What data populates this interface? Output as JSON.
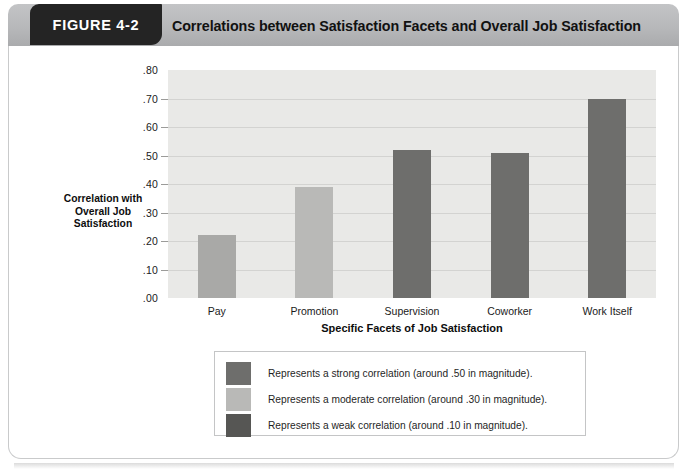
{
  "figure": {
    "tab_label": "FIGURE 4-2",
    "title": "Correlations between Satisfaction Facets and Overall Job Satisfaction"
  },
  "chart_data": {
    "type": "bar",
    "title": "Correlations between Satisfaction Facets and Overall Job Satisfaction",
    "xlabel": "Specific Facets of Job Satisfaction",
    "ylabel": "Correlation with Overall Job Satisfaction",
    "ylabel_lines": [
      "Correlation with",
      "Overall Job",
      "Satisfaction"
    ],
    "categories": [
      "Pay",
      "Promotion",
      "Supervision",
      "Coworker",
      "Work Itself"
    ],
    "values": [
      0.22,
      0.39,
      0.52,
      0.51,
      0.7
    ],
    "value_labels": [
      ".22",
      ".39",
      ".52",
      ".51",
      ".70"
    ],
    "bar_colors": [
      "#a9a9a7",
      "#b9b9b7",
      "#6e6e6c",
      "#6e6e6c",
      "#6e6e6c"
    ],
    "bar_strengths": [
      "moderate",
      "moderate",
      "strong",
      "strong",
      "strong"
    ],
    "ylim": [
      0.0,
      0.8
    ],
    "ytick_values": [
      0.0,
      0.1,
      0.2,
      0.3,
      0.4,
      0.5,
      0.6,
      0.7,
      0.8
    ],
    "ytick_labels": [
      ".00",
      ".10",
      ".20",
      ".30",
      ".40",
      ".50",
      ".60",
      ".70",
      ".80"
    ],
    "grid": true,
    "legend_position": "below-plot",
    "plot_background": "#e9e9e7"
  },
  "legend": {
    "items": [
      {
        "swatch_color": "#6e6e6c",
        "text": "Represents a strong correlation (around .50 in magnitude)."
      },
      {
        "swatch_color": "#b9b9b7",
        "text": "Represents a moderate correlation (around .30 in magnitude)."
      },
      {
        "swatch_color": "#565654",
        "text": "Represents a weak correlation (around .10 in magnitude)."
      }
    ]
  },
  "colors": {
    "header_banner": "#b7b8ba",
    "tab_background": "#242424",
    "card_background": "#ffffff",
    "gridline": "#d3d3d1"
  }
}
